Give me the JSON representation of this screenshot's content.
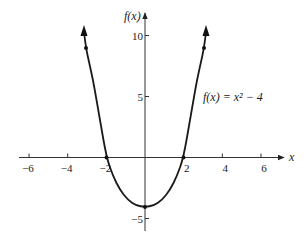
{
  "chart_data": {
    "type": "line",
    "title": "",
    "function_label": "f(x) = x² − 4",
    "xlabel": "x",
    "ylabel": "f(x)",
    "xlim": [
      -7,
      7
    ],
    "ylim": [
      -6,
      11
    ],
    "x_ticks": [
      -6,
      -4,
      -2,
      2,
      4,
      6
    ],
    "x_tick_labels": [
      "−6",
      "−4",
      "−2",
      "2",
      "4",
      "6"
    ],
    "y_ticks": [
      10,
      5,
      -5
    ],
    "y_tick_labels": [
      "10",
      "5",
      "−5"
    ],
    "grid": false,
    "legend": null,
    "series": [
      {
        "name": "f(x) = x² − 4",
        "x": [
          -3,
          -2,
          -1,
          0,
          1,
          2,
          3
        ],
        "values": [
          5,
          0,
          -3,
          -4,
          -3,
          0,
          5
        ],
        "marked_points": [
          [
            -3,
            5
          ],
          [
            -2,
            0
          ],
          [
            0,
            -4
          ],
          [
            2,
            0
          ],
          [
            3,
            5
          ]
        ],
        "arrows_on_ends": true
      }
    ],
    "colors": {
      "curve": "#1a1a1a",
      "axes": "#333333"
    }
  }
}
